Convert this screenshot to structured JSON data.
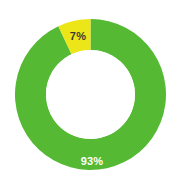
{
  "chart_data": {
    "type": "pie",
    "variant": "donut",
    "title": "",
    "subtitle": "",
    "xlabel": "",
    "ylabel": "",
    "legend": false,
    "grid": false,
    "start_angle_deg": 0,
    "direction": "counterclockwise",
    "inner_radius_ratio": 0.59,
    "categories": [
      "93%",
      "7%"
    ],
    "values": [
      93,
      7
    ],
    "slices": [
      {
        "label": "93%",
        "value": 93,
        "color": "#55B934",
        "label_color": "#ffffff",
        "sweep_deg": 334.8
      },
      {
        "label": "7%",
        "value": 7,
        "color": "#ECE618",
        "label_color": "#3a3a32",
        "sweep_deg": 25.2
      }
    ]
  },
  "chart": {
    "background_color": "#ffffff",
    "center_x": 90.5,
    "center_y": 94.5,
    "outer_radius": 75.5,
    "inner_radius": 44.5,
    "green": "#55B934",
    "yellow": "#ECE618",
    "hole_color": "#ffffff",
    "labels": {
      "green_label": "93%",
      "yellow_label": "7%"
    }
  }
}
